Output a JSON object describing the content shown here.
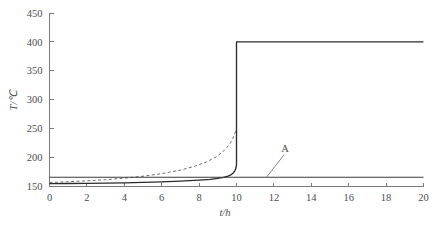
{
  "chart_data": {
    "type": "line",
    "title": "",
    "subtitle": "",
    "xlabel": "t/h",
    "ylabel": "T/℃",
    "xlim": [
      0,
      20
    ],
    "ylim": [
      150,
      450
    ],
    "xticks": [
      0,
      2,
      4,
      6,
      8,
      10,
      12,
      14,
      16,
      18,
      20
    ],
    "xtick_labels": [
      "0",
      "2",
      "4",
      "6",
      "8",
      "10",
      "12",
      "14",
      "16",
      "18",
      "20"
    ],
    "yticks": [
      150,
      200,
      250,
      300,
      350,
      400,
      450
    ],
    "ytick_labels": [
      "150",
      "200",
      "250",
      "300",
      "350",
      "400",
      "450"
    ],
    "grid": false,
    "legend": "none",
    "annotations": [
      {
        "text": "A",
        "x": 12.6,
        "y": 210,
        "points_to_x": 11.6,
        "points_to_y": 166
      }
    ],
    "series": [
      {
        "name": "step-curve",
        "style": "solid",
        "color": "#2b2b2b",
        "x": [
          0,
          1,
          2,
          3,
          4,
          5,
          6,
          7,
          8,
          8.6,
          9.0,
          9.3,
          9.55,
          9.72,
          9.84,
          9.92,
          9.97,
          10.0,
          10.0,
          11,
          12,
          13,
          14,
          15,
          16,
          17,
          18,
          19,
          20
        ],
        "y": [
          155,
          155.2,
          155.5,
          155.9,
          156.4,
          157.1,
          158.0,
          159.2,
          160.9,
          162.3,
          164.0,
          165.8,
          168.0,
          170.6,
          173.8,
          177.5,
          182.0,
          188.0,
          400,
          400,
          400,
          400,
          400,
          400,
          400,
          400,
          400,
          400,
          400
        ]
      },
      {
        "name": "divergent-dashed-curve",
        "style": "dashed",
        "color": "#6f6f6f",
        "x": [
          0,
          1,
          2,
          3,
          4,
          5,
          6,
          7,
          7.8,
          8.4,
          8.9,
          9.25,
          9.5,
          9.68,
          9.8,
          9.88,
          9.94,
          9.98,
          10.0
        ],
        "y": [
          157,
          158.2,
          159.8,
          161.8,
          164.4,
          167.8,
          172.2,
          178.4,
          185.4,
          192.6,
          201.0,
          209.6,
          218.0,
          225.8,
          232.8,
          239.0,
          244.2,
          248.2,
          250
        ]
      },
      {
        "name": "baseline-flat-line",
        "style": "solid",
        "color": "#3a3a3a",
        "x": [
          0,
          20
        ],
        "y": [
          166,
          166
        ]
      }
    ]
  }
}
